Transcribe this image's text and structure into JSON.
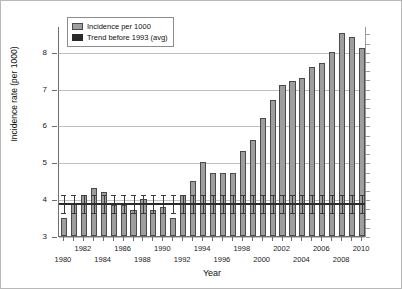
{
  "chart_data": {
    "type": "bar",
    "title": "",
    "xlabel": "Year",
    "ylabel": "Incidence rate (per 1000)",
    "ylim": [
      3,
      8.7
    ],
    "ytick_labels": [
      "3",
      "4",
      "5",
      "6",
      "7",
      "8"
    ],
    "ytick_values": [
      3,
      4,
      5,
      6,
      7,
      8
    ],
    "grid": "horizontal",
    "legend_position": "top-left",
    "categories": [
      "1980",
      "1981",
      "1982",
      "1983",
      "1984",
      "1985",
      "1986",
      "1987",
      "1988",
      "1989",
      "1990",
      "1991",
      "1992",
      "1993",
      "1994",
      "1995",
      "1996",
      "1997",
      "1998",
      "1999",
      "2000",
      "2001",
      "2002",
      "2003",
      "2004",
      "2005",
      "2006",
      "2007",
      "2008",
      "2009",
      "2010"
    ],
    "xtick_labels": [
      "1980",
      "1982",
      "1984",
      "1986",
      "1988",
      "1990",
      "1992",
      "1994",
      "1996",
      "1998",
      "2000",
      "2002",
      "2004",
      "2006",
      "2008",
      "2010"
    ],
    "series": [
      {
        "name": "Incidence per 1000",
        "color": "#9e9e9e",
        "values": [
          3.5,
          3.9,
          4.1,
          4.3,
          4.2,
          3.85,
          3.85,
          3.7,
          4.0,
          3.7,
          3.8,
          3.5,
          4.1,
          4.5,
          5.0,
          4.7,
          4.7,
          4.7,
          5.3,
          5.6,
          6.2,
          6.7,
          7.1,
          7.2,
          7.3,
          7.6,
          7.7,
          8.0,
          8.5,
          8.4,
          8.1
        ]
      },
      {
        "name": "Trend before 1993 (avg)",
        "color": "#2b2b2b",
        "value": 3.9
      }
    ],
    "error_bars": {
      "center": 3.9,
      "upper": 4.15,
      "lower": 3.65,
      "applies_to_all_categories": true
    },
    "legend": [
      {
        "label": "Incidence per 1000",
        "swatch": "incidence"
      },
      {
        "label": "Trend before 1993 (avg)",
        "swatch": "trend"
      }
    ]
  }
}
